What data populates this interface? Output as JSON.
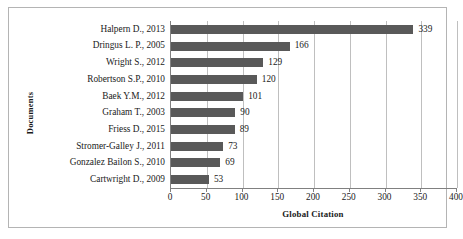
{
  "chart_data": {
    "type": "bar",
    "orientation": "horizontal",
    "title": "",
    "xlabel": "Global Citation",
    "ylabel": "Documents",
    "categories": [
      "Halpern D., 2013",
      "Dringus L. P., 2005",
      "Wright S., 2012",
      "Robertson S.P., 2010",
      "Baek Y.M., 2012",
      "Graham T., 2003",
      "Friess D., 2015",
      "Stromer-Galley J., 2011",
      "Gonzalez Bailon S., 2010",
      "Cartwright D., 2009"
    ],
    "values": [
      339,
      166,
      129,
      120,
      101,
      90,
      89,
      73,
      69,
      53
    ],
    "data_labels": [
      "339",
      "166",
      "129",
      "120",
      "101",
      "90",
      "89",
      "73",
      "69",
      "53"
    ],
    "xlim": [
      0,
      400
    ],
    "xticks": [
      0,
      50,
      100,
      150,
      200,
      250,
      300,
      350,
      400
    ],
    "xtick_labels": [
      "0",
      "50",
      "100",
      "150",
      "200",
      "250",
      "300",
      "350",
      "400"
    ],
    "grid": "vertical",
    "legend": "none",
    "bar_color": "#595959",
    "gridline_color": "#bfbfbf",
    "axis_color": "#808080",
    "frame_color": "#b4b4b4",
    "background": "#ffffff"
  }
}
